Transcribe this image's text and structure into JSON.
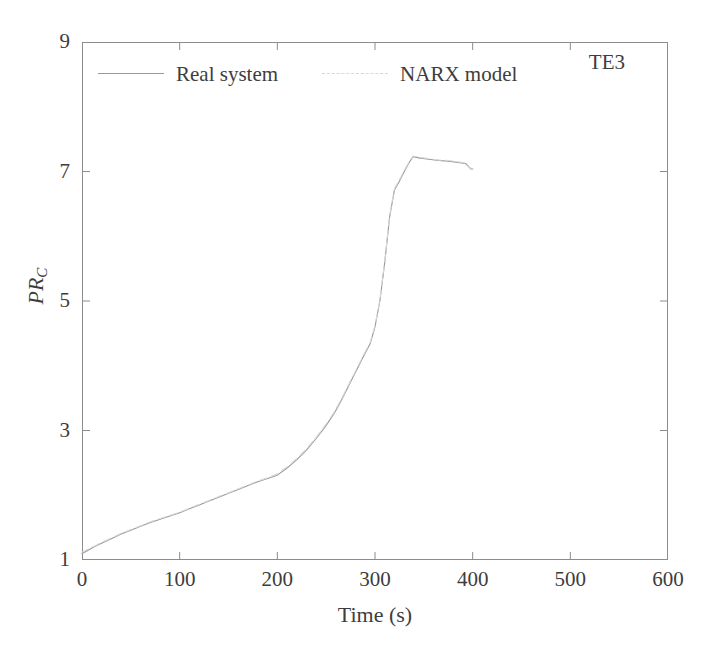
{
  "chart_data": {
    "type": "line",
    "title": "",
    "annotation": "TE3",
    "xlabel": "Time (s)",
    "ylabel": "PR_C",
    "ylabel_base": "PR",
    "ylabel_sub": "C",
    "xlim": [
      0,
      600
    ],
    "ylim": [
      1,
      9
    ],
    "xticks": [
      0,
      100,
      200,
      300,
      400,
      500,
      600
    ],
    "yticks": [
      1,
      3,
      5,
      7,
      9
    ],
    "xtick_labels": [
      "0",
      "100",
      "200",
      "300",
      "400",
      "500",
      "600"
    ],
    "ytick_labels": [
      "1",
      "3",
      "5",
      "7",
      "9"
    ],
    "grid": false,
    "legend_position": "top-left-inside",
    "legend": [
      "Real system",
      "NARX model"
    ],
    "series": [
      {
        "name": "Real system",
        "color": "#9a9a9a",
        "style": "solid",
        "x": [
          0,
          5,
          12,
          20,
          30,
          40,
          50,
          60,
          70,
          80,
          90,
          100,
          110,
          120,
          130,
          140,
          150,
          160,
          170,
          180,
          190,
          200,
          210,
          220,
          230,
          240,
          250,
          258,
          265,
          272,
          280,
          288,
          295,
          300,
          305,
          310,
          315,
          320,
          325,
          330,
          335,
          339,
          345,
          355,
          365,
          375,
          385,
          393,
          398,
          400
        ],
        "y": [
          1.1,
          1.14,
          1.2,
          1.26,
          1.33,
          1.4,
          1.46,
          1.52,
          1.58,
          1.63,
          1.68,
          1.73,
          1.79,
          1.85,
          1.91,
          1.97,
          2.03,
          2.09,
          2.15,
          2.21,
          2.26,
          2.31,
          2.42,
          2.55,
          2.7,
          2.88,
          3.08,
          3.26,
          3.45,
          3.66,
          3.9,
          4.14,
          4.34,
          4.6,
          5.0,
          5.6,
          6.3,
          6.72,
          6.85,
          7.0,
          7.14,
          7.23,
          7.21,
          7.19,
          7.17,
          7.16,
          7.14,
          7.12,
          7.04,
          7.04
        ]
      },
      {
        "name": "NARX model",
        "color": "#d8d8d8",
        "style": "dashed",
        "x": [
          0,
          5,
          12,
          20,
          30,
          40,
          50,
          60,
          70,
          80,
          90,
          100,
          110,
          120,
          130,
          140,
          150,
          160,
          170,
          180,
          190,
          200,
          210,
          220,
          230,
          240,
          250,
          258,
          265,
          272,
          280,
          288,
          295,
          300,
          305,
          310,
          315,
          320,
          325,
          330,
          335,
          339,
          345,
          355,
          365,
          375,
          385,
          393,
          398,
          400
        ],
        "y": [
          1.12,
          1.16,
          1.21,
          1.27,
          1.34,
          1.41,
          1.47,
          1.53,
          1.59,
          1.64,
          1.69,
          1.74,
          1.8,
          1.86,
          1.92,
          1.98,
          2.04,
          2.1,
          2.16,
          2.22,
          2.27,
          2.33,
          2.44,
          2.57,
          2.72,
          2.9,
          3.1,
          3.28,
          3.47,
          3.68,
          3.92,
          4.16,
          4.36,
          4.62,
          5.02,
          5.62,
          6.32,
          6.74,
          6.87,
          7.02,
          7.15,
          7.24,
          7.22,
          7.2,
          7.18,
          7.17,
          7.15,
          7.13,
          7.05,
          7.05
        ]
      }
    ],
    "notable_points": {
      "start_value": 1.1,
      "peak_value": 7.23,
      "peak_time": 339,
      "end_value": 7.04,
      "end_time": 400
    }
  },
  "axes": {
    "frame_color": "#8c8c8c",
    "tick_color": "#8c8c8c"
  }
}
